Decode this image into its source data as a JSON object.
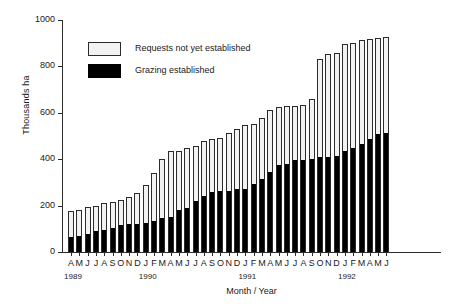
{
  "chart_data": {
    "type": "bar",
    "subtype": "stacked-vertical",
    "title": "",
    "xlabel": "Month / Year",
    "ylabel": "Thousands ha",
    "ylim": [
      0,
      1000
    ],
    "yticks": [
      0,
      200,
      400,
      600,
      800,
      1000
    ],
    "ytick_labels": [
      "0",
      "200",
      "400",
      "600",
      "800",
      "1000"
    ],
    "grid": false,
    "legend_position": "upper-left-inside",
    "categories": [
      "A",
      "M",
      "J",
      "J",
      "A",
      "S",
      "O",
      "N",
      "D",
      "J",
      "F",
      "M",
      "A",
      "M",
      "J",
      "J",
      "A",
      "S",
      "O",
      "N",
      "D",
      "J",
      "F",
      "M",
      "A",
      "M",
      "J",
      "J",
      "A",
      "S",
      "O",
      "N",
      "D",
      "J",
      "F",
      "M",
      "A",
      "M",
      "J"
    ],
    "year_groups": [
      {
        "year": "1989",
        "start_index": 0,
        "count": 9
      },
      {
        "year": "1990",
        "start_index": 9,
        "count": 12
      },
      {
        "year": "1991",
        "start_index": 21,
        "count": 12
      },
      {
        "year": "1992",
        "start_index": 33,
        "count": 6
      }
    ],
    "series": [
      {
        "name": "Grazing established",
        "color": "#000000",
        "values": [
          65,
          70,
          78,
          92,
          97,
          105,
          117,
          120,
          122,
          125,
          135,
          147,
          152,
          182,
          190,
          218,
          240,
          258,
          262,
          265,
          270,
          272,
          292,
          313,
          343,
          375,
          378,
          395,
          395,
          400,
          408,
          410,
          413,
          435,
          448,
          465,
          488,
          510,
          512
        ]
      },
      {
        "name": "Requests not yet established",
        "color": "#f2f2f2",
        "values": [
          110,
          113,
          117,
          108,
          113,
          112,
          108,
          117,
          133,
          163,
          205,
          253,
          285,
          255,
          260,
          240,
          238,
          228,
          230,
          247,
          260,
          275,
          258,
          265,
          267,
          248,
          250,
          235,
          240,
          258,
          422,
          445,
          443,
          462,
          452,
          448,
          432,
          412,
          415
        ]
      }
    ],
    "totals": [
      175,
      183,
      195,
      200,
      210,
      217,
      225,
      237,
      255,
      288,
      340,
      400,
      437,
      437,
      450,
      458,
      478,
      486,
      492,
      512,
      530,
      547,
      550,
      578,
      610,
      623,
      628,
      630,
      635,
      658,
      830,
      855,
      856,
      897,
      900,
      913,
      920,
      922,
      927
    ]
  },
  "legend": {
    "items": [
      {
        "label": "Requests not yet established",
        "style": "light"
      },
      {
        "label": "Grazing established",
        "style": "dark"
      }
    ]
  },
  "axes": {
    "y_title": "Thousands ha",
    "x_title": "Month / Year"
  }
}
